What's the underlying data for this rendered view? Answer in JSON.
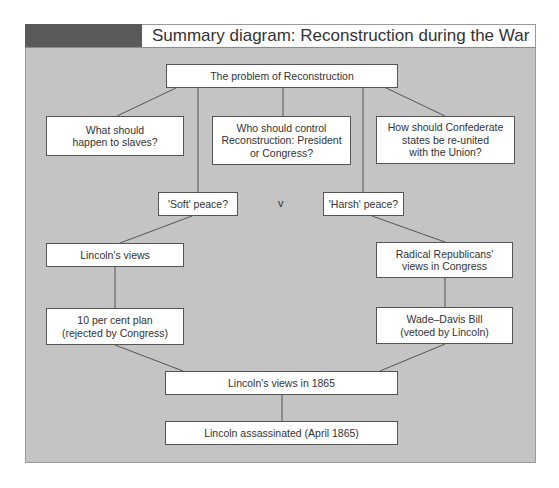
{
  "header": {
    "title": "Summary diagram: Reconstruction during the War"
  },
  "diagram": {
    "root": "The problem of Reconstruction",
    "questions": [
      "What should\nhappen to slaves?",
      "Who should control\nReconstruction: President\nor Congress?",
      "How should Confederate\nstates be re-united\nwith the Union?"
    ],
    "soft_peace": "'Soft' peace?",
    "versus": "v",
    "harsh_peace": "'Harsh' peace?",
    "left_branch": {
      "views": "Lincoln's views",
      "plan": "10 per cent plan\n(rejected by Congress)"
    },
    "right_branch": {
      "views": "Radical Republicans'\nviews in Congress",
      "bill": "Wade–Davis Bill\n(vetoed by Lincoln)"
    },
    "outcome": "Lincoln's views in 1865",
    "final": "Lincoln assassinated (April 1865)"
  },
  "colors": {
    "panel_bg": "#c4c4c4",
    "header_dark": "#5a5a5a",
    "box_bg": "#ffffff",
    "line": "#555555"
  }
}
